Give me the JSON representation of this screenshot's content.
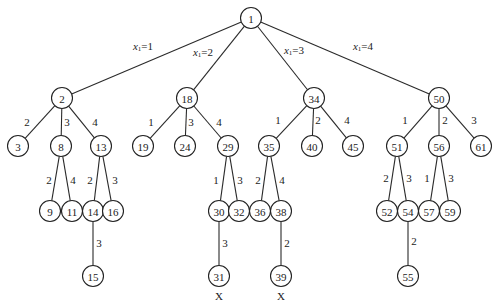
{
  "diagram": {
    "type": "tree",
    "node_radius": 10.5,
    "stroke_color": "#222222",
    "background": "#ffffff",
    "nodes": [
      {
        "id": "1",
        "label": "1",
        "x": 251,
        "y": 18
      },
      {
        "id": "2",
        "label": "2",
        "x": 62,
        "y": 98
      },
      {
        "id": "18",
        "label": "18",
        "x": 187,
        "y": 98
      },
      {
        "id": "34",
        "label": "34",
        "x": 314,
        "y": 98
      },
      {
        "id": "50",
        "label": "50",
        "x": 439,
        "y": 98
      },
      {
        "id": "3",
        "label": "3",
        "x": 18,
        "y": 146
      },
      {
        "id": "8",
        "label": "8",
        "x": 61,
        "y": 146
      },
      {
        "id": "13",
        "label": "13",
        "x": 101,
        "y": 146
      },
      {
        "id": "19",
        "label": "19",
        "x": 143,
        "y": 146
      },
      {
        "id": "24",
        "label": "24",
        "x": 185,
        "y": 146
      },
      {
        "id": "29",
        "label": "29",
        "x": 228,
        "y": 146
      },
      {
        "id": "35",
        "label": "35",
        "x": 269,
        "y": 146
      },
      {
        "id": "40",
        "label": "40",
        "x": 312,
        "y": 146
      },
      {
        "id": "45",
        "label": "45",
        "x": 353,
        "y": 146
      },
      {
        "id": "51",
        "label": "51",
        "x": 397,
        "y": 146
      },
      {
        "id": "56",
        "label": "56",
        "x": 439,
        "y": 146
      },
      {
        "id": "61",
        "label": "61",
        "x": 481,
        "y": 146
      },
      {
        "id": "9",
        "label": "9",
        "x": 50,
        "y": 211
      },
      {
        "id": "11",
        "label": "11",
        "x": 72,
        "y": 211
      },
      {
        "id": "14",
        "label": "14",
        "x": 93,
        "y": 211
      },
      {
        "id": "16",
        "label": "16",
        "x": 113,
        "y": 211
      },
      {
        "id": "30",
        "label": "30",
        "x": 219,
        "y": 211
      },
      {
        "id": "32",
        "label": "32",
        "x": 239,
        "y": 211
      },
      {
        "id": "36",
        "label": "36",
        "x": 260,
        "y": 211
      },
      {
        "id": "38",
        "label": "38",
        "x": 281,
        "y": 211
      },
      {
        "id": "52",
        "label": "52",
        "x": 387,
        "y": 211
      },
      {
        "id": "54",
        "label": "54",
        "x": 408,
        "y": 211
      },
      {
        "id": "57",
        "label": "57",
        "x": 429,
        "y": 211
      },
      {
        "id": "59",
        "label": "59",
        "x": 450,
        "y": 211
      },
      {
        "id": "15",
        "label": "15",
        "x": 93,
        "y": 276
      },
      {
        "id": "31",
        "label": "31",
        "x": 219,
        "y": 276
      },
      {
        "id": "39",
        "label": "39",
        "x": 281,
        "y": 276
      },
      {
        "id": "55",
        "label": "55",
        "x": 408,
        "y": 276
      }
    ],
    "edges": [
      {
        "from": "1",
        "to": "2",
        "label": "x1=1",
        "var": "x",
        "sub": "1",
        "val": "=1",
        "lx": 143,
        "ly": 46
      },
      {
        "from": "1",
        "to": "18",
        "label": "x1=2",
        "var": "x",
        "sub": "1",
        "val": "=2",
        "lx": 203,
        "ly": 52
      },
      {
        "from": "1",
        "to": "34",
        "label": "x1=3",
        "var": "x",
        "sub": "1",
        "val": "=3",
        "lx": 294,
        "ly": 50
      },
      {
        "from": "1",
        "to": "50",
        "label": "x1=4",
        "var": "x",
        "sub": "1",
        "val": "=4",
        "lx": 363,
        "ly": 46
      },
      {
        "from": "2",
        "to": "3",
        "label": "2",
        "lx": 27,
        "ly": 122
      },
      {
        "from": "2",
        "to": "8",
        "label": "3",
        "lx": 67,
        "ly": 122
      },
      {
        "from": "2",
        "to": "13",
        "label": "4",
        "lx": 95,
        "ly": 122
      },
      {
        "from": "18",
        "to": "19",
        "label": "1",
        "lx": 151,
        "ly": 122
      },
      {
        "from": "18",
        "to": "24",
        "label": "3",
        "lx": 191,
        "ly": 122
      },
      {
        "from": "18",
        "to": "29",
        "label": "4",
        "lx": 219,
        "ly": 122
      },
      {
        "from": "34",
        "to": "35",
        "label": "1",
        "lx": 278,
        "ly": 120
      },
      {
        "from": "34",
        "to": "40",
        "label": "2",
        "lx": 318,
        "ly": 120
      },
      {
        "from": "34",
        "to": "45",
        "label": "4",
        "lx": 347,
        "ly": 120
      },
      {
        "from": "50",
        "to": "51",
        "label": "1",
        "lx": 405,
        "ly": 120
      },
      {
        "from": "50",
        "to": "56",
        "label": "2",
        "lx": 445,
        "ly": 120
      },
      {
        "from": "50",
        "to": "61",
        "label": "3",
        "lx": 474,
        "ly": 120
      },
      {
        "from": "8",
        "to": "9",
        "label": "2",
        "lx": 49,
        "ly": 180
      },
      {
        "from": "8",
        "to": "11",
        "label": "4",
        "lx": 73,
        "ly": 180
      },
      {
        "from": "13",
        "to": "14",
        "label": "2",
        "lx": 90,
        "ly": 180
      },
      {
        "from": "13",
        "to": "16",
        "label": "3",
        "lx": 115,
        "ly": 180
      },
      {
        "from": "29",
        "to": "30",
        "label": "1",
        "lx": 216,
        "ly": 180
      },
      {
        "from": "29",
        "to": "32",
        "label": "3",
        "lx": 240,
        "ly": 180
      },
      {
        "from": "35",
        "to": "36",
        "label": "2",
        "lx": 258,
        "ly": 180
      },
      {
        "from": "35",
        "to": "38",
        "label": "4",
        "lx": 282,
        "ly": 180
      },
      {
        "from": "51",
        "to": "52",
        "label": "2",
        "lx": 386,
        "ly": 178
      },
      {
        "from": "51",
        "to": "54",
        "label": "3",
        "lx": 409,
        "ly": 178
      },
      {
        "from": "56",
        "to": "57",
        "label": "1",
        "lx": 427,
        "ly": 178
      },
      {
        "from": "56",
        "to": "59",
        "label": "3",
        "lx": 451,
        "ly": 178
      },
      {
        "from": "14",
        "to": "15",
        "label": "3",
        "lx": 99,
        "ly": 243
      },
      {
        "from": "30",
        "to": "31",
        "label": "3",
        "lx": 225,
        "ly": 243
      },
      {
        "from": "38",
        "to": "39",
        "label": "2",
        "lx": 287,
        "ly": 243
      },
      {
        "from": "54",
        "to": "55",
        "label": "2",
        "lx": 414,
        "ly": 241
      }
    ],
    "marks": [
      {
        "node": "31",
        "label": "X",
        "x": 219,
        "y": 296
      },
      {
        "node": "39",
        "label": "X",
        "x": 281,
        "y": 296
      }
    ]
  }
}
